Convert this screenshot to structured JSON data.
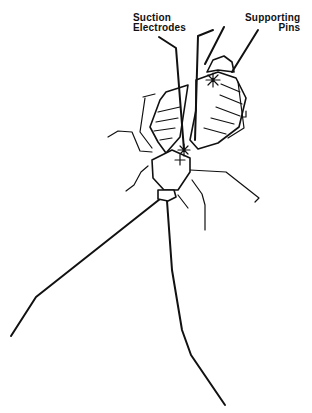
{
  "figure": {
    "labels": {
      "suction_electrodes": [
        "Suction",
        "Electrodes"
      ],
      "supporting_pins": [
        "Supporting",
        "Pins"
      ]
    }
  }
}
